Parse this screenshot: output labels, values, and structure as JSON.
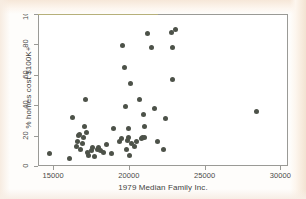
{
  "chart_data": {
    "type": "scatter",
    "title": "",
    "xlabel": "1979 Median Family Inc.",
    "ylabel": "% homes cost $100K+",
    "xlim": [
      14000,
      30500
    ],
    "ylim": [
      0,
      100
    ],
    "xticks": [
      15000,
      20000,
      25000,
      30000
    ],
    "xticklabels": [
      "15000",
      "20000",
      "25000",
      "30000"
    ],
    "yticks": [
      0,
      20,
      40,
      60,
      80,
      100
    ],
    "yticklabels": [
      "0",
      "20",
      "40",
      "60",
      "80",
      "100"
    ],
    "grid": false,
    "legend": null,
    "marker": "filled-circle",
    "marker_color": "#4d5249",
    "frame_color": "#9a9a96",
    "background_color": "#ffffff",
    "points": [
      {
        "x": 14750,
        "y": 8
      },
      {
        "x": 16100,
        "y": 5
      },
      {
        "x": 16250,
        "y": 32
      },
      {
        "x": 16550,
        "y": 13
      },
      {
        "x": 16600,
        "y": 16
      },
      {
        "x": 16700,
        "y": 20
      },
      {
        "x": 16750,
        "y": 21
      },
      {
        "x": 16800,
        "y": 11
      },
      {
        "x": 16950,
        "y": 15
      },
      {
        "x": 17000,
        "y": 19
      },
      {
        "x": 17100,
        "y": 26
      },
      {
        "x": 17150,
        "y": 44
      },
      {
        "x": 17200,
        "y": 22
      },
      {
        "x": 17250,
        "y": 9
      },
      {
        "x": 17350,
        "y": 7
      },
      {
        "x": 17500,
        "y": 10
      },
      {
        "x": 17600,
        "y": 12
      },
      {
        "x": 17700,
        "y": 6
      },
      {
        "x": 17900,
        "y": 11
      },
      {
        "x": 18000,
        "y": 12
      },
      {
        "x": 18100,
        "y": 10
      },
      {
        "x": 18350,
        "y": 9
      },
      {
        "x": 18500,
        "y": 14
      },
      {
        "x": 18850,
        "y": 8
      },
      {
        "x": 19000,
        "y": 25
      },
      {
        "x": 19400,
        "y": 16
      },
      {
        "x": 19500,
        "y": 18
      },
      {
        "x": 19600,
        "y": 79
      },
      {
        "x": 19700,
        "y": 65
      },
      {
        "x": 19800,
        "y": 39
      },
      {
        "x": 19850,
        "y": 11
      },
      {
        "x": 19900,
        "y": 17
      },
      {
        "x": 19950,
        "y": 19
      },
      {
        "x": 20000,
        "y": 25
      },
      {
        "x": 20050,
        "y": 7
      },
      {
        "x": 20100,
        "y": 54
      },
      {
        "x": 20150,
        "y": 15
      },
      {
        "x": 20350,
        "y": 13
      },
      {
        "x": 20500,
        "y": 16
      },
      {
        "x": 20700,
        "y": 44
      },
      {
        "x": 20800,
        "y": 18
      },
      {
        "x": 20900,
        "y": 19
      },
      {
        "x": 20950,
        "y": 34
      },
      {
        "x": 21000,
        "y": 26
      },
      {
        "x": 21050,
        "y": 19
      },
      {
        "x": 21200,
        "y": 87
      },
      {
        "x": 21500,
        "y": 78
      },
      {
        "x": 21700,
        "y": 38
      },
      {
        "x": 21900,
        "y": 16
      },
      {
        "x": 22250,
        "y": 11
      },
      {
        "x": 22400,
        "y": 31
      },
      {
        "x": 22800,
        "y": 88
      },
      {
        "x": 22850,
        "y": 78
      },
      {
        "x": 22900,
        "y": 57
      },
      {
        "x": 23050,
        "y": 90
      },
      {
        "x": 28400,
        "y": 36
      }
    ]
  }
}
